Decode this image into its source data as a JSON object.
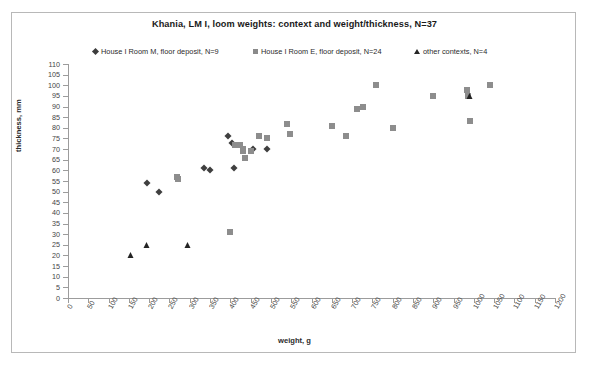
{
  "chart_data": {
    "type": "scatter",
    "title": "Khania, LM I, loom weights: context and weight/thickness, N=37",
    "xlabel": "weight, g",
    "ylabel": "thickness, mm",
    "xlim": [
      0,
      1200
    ],
    "ylim": [
      0,
      110
    ],
    "xticks": [
      0,
      50,
      100,
      150,
      200,
      250,
      300,
      350,
      400,
      450,
      500,
      550,
      600,
      650,
      700,
      750,
      800,
      850,
      900,
      950,
      1000,
      1050,
      1100,
      1150,
      1200
    ],
    "yticks": [
      0,
      5,
      10,
      15,
      20,
      25,
      30,
      35,
      40,
      45,
      50,
      55,
      60,
      65,
      70,
      75,
      80,
      85,
      90,
      95,
      100,
      105,
      110
    ],
    "grid": false,
    "legend_position": "top",
    "colors": {
      "series_1": "#3f3f3f",
      "series_2": "#8d8d8d",
      "series_3": "#242424",
      "axis": "#9c9c9c",
      "frame": "#b8b8b8",
      "text": "#2b2b2b"
    },
    "series": [
      {
        "name": "House I Room M, floor deposit, N=9",
        "marker": "diamond",
        "color": "#3f3f3f",
        "count": 9,
        "points": [
          [
            195,
            54
          ],
          [
            225,
            50
          ],
          [
            335,
            61
          ],
          [
            350,
            60
          ],
          [
            395,
            76
          ],
          [
            403,
            73
          ],
          [
            410,
            61
          ],
          [
            455,
            70
          ],
          [
            490,
            70
          ]
        ]
      },
      {
        "name": "House I Room E, floor deposit, N=24",
        "marker": "square",
        "color": "#8d8d8d",
        "count": 24,
        "points": [
          [
            268,
            57
          ],
          [
            272,
            56
          ],
          [
            398,
            31
          ],
          [
            412,
            72
          ],
          [
            425,
            72
          ],
          [
            432,
            69
          ],
          [
            437,
            66
          ],
          [
            450,
            69
          ],
          [
            470,
            76
          ],
          [
            490,
            75
          ],
          [
            540,
            82
          ],
          [
            548,
            77
          ],
          [
            650,
            81
          ],
          [
            685,
            76
          ],
          [
            712,
            89
          ],
          [
            726,
            90
          ],
          [
            760,
            100
          ],
          [
            800,
            80
          ],
          [
            900,
            95
          ],
          [
            984,
            98
          ],
          [
            986,
            95
          ],
          [
            990,
            83
          ],
          [
            1040,
            100
          ],
          [
            430,
            70
          ]
        ]
      },
      {
        "name": "other contexts, N=4",
        "marker": "triangle",
        "color": "#242424",
        "count": 4,
        "points": [
          [
            155,
            20
          ],
          [
            195,
            25
          ],
          [
            295,
            25
          ],
          [
            990,
            95
          ]
        ]
      }
    ]
  }
}
